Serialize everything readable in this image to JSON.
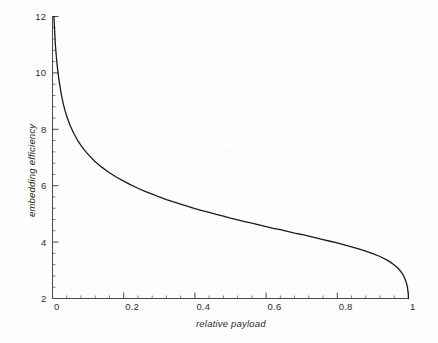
{
  "chart_data": {
    "type": "line",
    "title": "",
    "xlabel": "relative payload",
    "ylabel": "embedding efficiency",
    "xlim": [
      0,
      1
    ],
    "ylim": [
      2,
      12
    ],
    "grid": false,
    "legend": null,
    "xticks": [
      "0",
      "0.2",
      "0.4",
      "0.6",
      "0.8",
      "1"
    ],
    "xtick_values": [
      0,
      0.2,
      0.4,
      0.6,
      0.8,
      1
    ],
    "yticks": [
      "2",
      "4",
      "6",
      "8",
      "10",
      "12"
    ],
    "ytick_values": [
      2,
      4,
      6,
      8,
      10,
      12
    ],
    "x_minor_step": 0.04,
    "y_minor_step": 0.4,
    "line_color": "#1a1a1a",
    "line_width": 1.3,
    "series": [
      {
        "name": "embedding efficiency",
        "x": [
          0.004,
          0.008,
          0.012,
          0.016,
          0.02,
          0.025,
          0.03,
          0.035,
          0.04,
          0.05,
          0.06,
          0.07,
          0.08,
          0.09,
          0.1,
          0.12,
          0.14,
          0.16,
          0.18,
          0.2,
          0.22,
          0.24,
          0.26,
          0.28,
          0.3,
          0.32,
          0.34,
          0.36,
          0.38,
          0.4,
          0.42,
          0.44,
          0.46,
          0.48,
          0.5,
          0.52,
          0.54,
          0.56,
          0.58,
          0.6,
          0.62,
          0.64,
          0.66,
          0.68,
          0.7,
          0.72,
          0.74,
          0.76,
          0.78,
          0.8,
          0.82,
          0.84,
          0.86,
          0.88,
          0.9,
          0.92,
          0.94,
          0.95,
          0.96,
          0.97,
          0.98,
          0.985,
          0.99,
          0.994,
          0.997,
          0.999,
          1.0
        ],
        "y": [
          12.0,
          11.0,
          10.4,
          9.95,
          9.6,
          9.22,
          8.92,
          8.67,
          8.46,
          8.12,
          7.85,
          7.62,
          7.43,
          7.26,
          7.11,
          6.85,
          6.64,
          6.46,
          6.3,
          6.16,
          6.03,
          5.91,
          5.8,
          5.7,
          5.6,
          5.51,
          5.43,
          5.35,
          5.27,
          5.19,
          5.12,
          5.05,
          4.98,
          4.92,
          4.85,
          4.79,
          4.73,
          4.67,
          4.61,
          4.55,
          4.49,
          4.44,
          4.38,
          4.32,
          4.27,
          4.21,
          4.15,
          4.09,
          4.03,
          3.97,
          3.9,
          3.83,
          3.76,
          3.68,
          3.59,
          3.49,
          3.36,
          3.28,
          3.19,
          3.08,
          2.93,
          2.83,
          2.7,
          2.56,
          2.41,
          2.2,
          2.0
        ]
      }
    ]
  },
  "axes": {
    "x_title": "relative payload",
    "y_title": "embedding efficiency"
  }
}
